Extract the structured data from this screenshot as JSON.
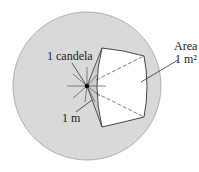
{
  "labels": {
    "candela": "1 candela",
    "radius": "1 m",
    "area_title": "Area",
    "area_value": "1 m²"
  },
  "colors": {
    "sphere_fill": "#d9d9d9",
    "sphere_stroke": "#9a9a9a",
    "patch_fill": "#ffffff",
    "cone_fill": "#cfcfcf",
    "line": "#333333"
  }
}
